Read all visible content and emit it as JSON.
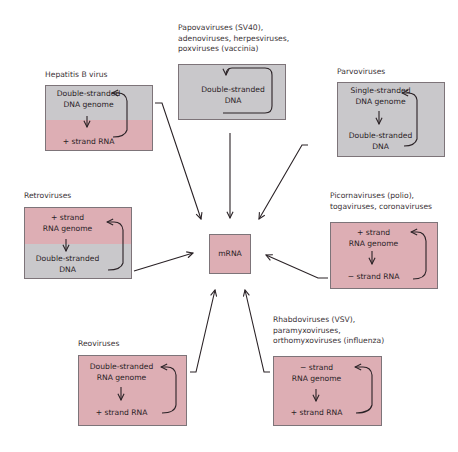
{
  "center": {
    "label": "mRNA"
  },
  "groups": [
    {
      "id": "hepatitis-b",
      "title": [
        "Hepatitis B virus"
      ],
      "top": "Double-stranded\nDNA genome",
      "bottom": "+ strand RNA",
      "top_color": "gray",
      "bottom_color": "pink"
    },
    {
      "id": "papova",
      "title": [
        "Papovaviruses (SV40),",
        "adenoviruses, herpesviruses,",
        "poxviruses (vaccinia)"
      ],
      "top": "Double-stranded\nDNA",
      "top_color": "gray"
    },
    {
      "id": "parvo",
      "title": [
        "Parvoviruses"
      ],
      "top": "Single-stranded\nDNA genome",
      "bottom": "Double-stranded\nDNA",
      "top_color": "gray",
      "bottom_color": "gray"
    },
    {
      "id": "retro",
      "title": [
        "Retroviruses"
      ],
      "top": "+ strand\nRNA genome",
      "bottom": "Double-stranded\nDNA",
      "top_color": "pink",
      "bottom_color": "gray"
    },
    {
      "id": "picorna",
      "title": [
        "Picornaviruses (polio),",
        "togaviruses, coronaviruses"
      ],
      "top": "+ strand\nRNA genome",
      "bottom": "− strand RNA",
      "top_color": "pink",
      "bottom_color": "pink"
    },
    {
      "id": "reo",
      "title": [
        "Reoviruses"
      ],
      "top": "Double-stranded\nRNA genome",
      "bottom": "+ strand RNA",
      "top_color": "pink",
      "bottom_color": "pink"
    },
    {
      "id": "rhabdo",
      "title": [
        "Rhabdoviruses (VSV),",
        "paramyxoviruses,",
        "orthomyxoviruses (influenza)"
      ],
      "top": "− strand\nRNA genome",
      "bottom": "+ strand RNA",
      "top_color": "pink",
      "bottom_color": "pink"
    }
  ],
  "colors": {
    "gray": "#c9c8cb",
    "pink": "#ddaeb4",
    "line": "#2a2226"
  }
}
